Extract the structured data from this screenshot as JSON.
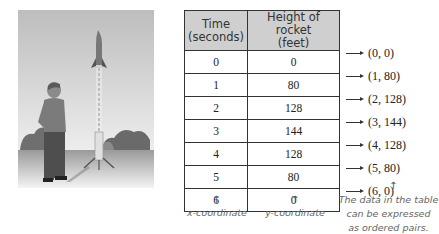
{
  "table": {
    "headers": [
      "Time\n(seconds)",
      "Height of rocket\n(feet)"
    ],
    "header_time_line1": "Time",
    "header_time_line2": "(seconds)",
    "header_height_line1": "Height of rocket",
    "header_height_line2": "(feet)",
    "rows": [
      {
        "time": "0",
        "height": "0"
      },
      {
        "time": "1",
        "height": "80"
      },
      {
        "time": "2",
        "height": "128"
      },
      {
        "time": "3",
        "height": "144"
      },
      {
        "time": "4",
        "height": "128"
      },
      {
        "time": "5",
        "height": "80"
      },
      {
        "time": "6",
        "height": "0"
      }
    ]
  },
  "ordered_pairs": [
    "(0, 0)",
    "(1, 80)",
    "(2, 128)",
    "(3, 144)",
    "(4, 128)",
    "(5, 80)",
    "(6, 0)"
  ],
  "annotations": {
    "x_label": "x-coordinate",
    "y_label": "y-coordinate",
    "pairs_note_line1": "The data in the table",
    "pairs_note_line2": "can be expressed",
    "pairs_note_line3": "as ordered pairs.",
    "up_arrow": "↑"
  },
  "illustration": {
    "description": "Boy watching a model rocket launch from a launch pad",
    "icons": [
      "rocket-icon",
      "person-icon",
      "launch-pad-icon",
      "trees-icon"
    ]
  }
}
